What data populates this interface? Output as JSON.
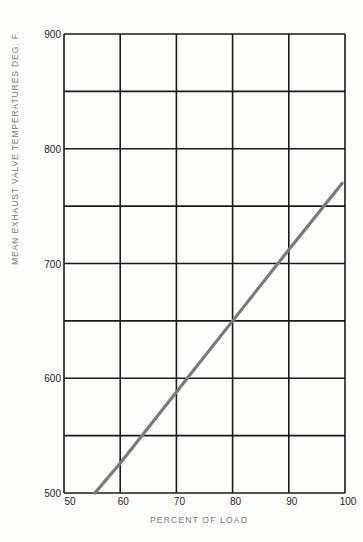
{
  "chart_data": {
    "type": "line",
    "title": "",
    "xlabel": "PERCENT OF LOAD",
    "ylabel": "MEAN EXHAUST VALVE TEMPERATURES DEG. F.",
    "xlim": [
      50,
      100
    ],
    "ylim": [
      500,
      900
    ],
    "x_ticks": [
      "50",
      "60",
      "70",
      "80",
      "90",
      "100"
    ],
    "y_ticks": [
      "500",
      "600",
      "700",
      "800",
      "900"
    ],
    "grid": true,
    "legend": null,
    "series": [
      {
        "name": "Mean exhaust valve temperature",
        "color": "#7a7a7a",
        "x": [
          55.5,
          60,
          70,
          80,
          90,
          99.5
        ],
        "y": [
          500,
          526,
          588,
          650,
          712,
          770
        ]
      }
    ]
  }
}
